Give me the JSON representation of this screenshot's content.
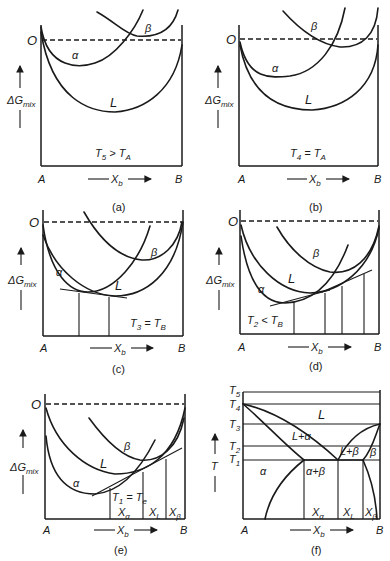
{
  "figure": {
    "panels": [
      {
        "id": "a",
        "caption": "(a)",
        "condition": {
          "T": "T",
          "T_sub": "5",
          "rel": " > ",
          "R": "T",
          "R_sub": "A"
        },
        "curve_labels": [
          "α",
          "β",
          "L"
        ],
        "origin_label": "O",
        "y_axis": {
          "main": "ΔG",
          "sub": "mix"
        },
        "x_axis": {
          "left": "A",
          "right": "B",
          "label": "X",
          "label_sub": "b"
        }
      },
      {
        "id": "b",
        "caption": "(b)",
        "condition": {
          "T": "T",
          "T_sub": "4",
          "rel": " = ",
          "R": "T",
          "R_sub": "A"
        },
        "curve_labels": [
          "α",
          "β",
          "L"
        ],
        "origin_label": "O",
        "y_axis": {
          "main": "ΔG",
          "sub": "mix"
        },
        "x_axis": {
          "left": "A",
          "right": "B",
          "label": "X",
          "label_sub": "b"
        }
      },
      {
        "id": "c",
        "caption": "(c)",
        "condition": {
          "T": "T",
          "T_sub": "3",
          "rel": " = ",
          "R": "T",
          "R_sub": "B"
        },
        "curve_labels": [
          "α",
          "β",
          "L"
        ],
        "origin_label": "O",
        "y_axis": {
          "main": "ΔG",
          "sub": "mix"
        },
        "x_axis": {
          "left": "A",
          "right": "B",
          "label": "X",
          "label_sub": "b"
        }
      },
      {
        "id": "d",
        "caption": "(d)",
        "condition": {
          "T": "T",
          "T_sub": "2",
          "rel": " < ",
          "R": "T",
          "R_sub": "B"
        },
        "curve_labels": [
          "α",
          "β",
          "L"
        ],
        "origin_label": "O",
        "y_axis": {
          "main": "ΔG",
          "sub": "mix"
        },
        "x_axis": {
          "left": "A",
          "right": "B",
          "label": "X",
          "label_sub": "b"
        }
      },
      {
        "id": "e",
        "caption": "(e)",
        "condition": {
          "T": "T",
          "T_sub": "1",
          "rel": " = ",
          "R": "T",
          "R_sub": "e"
        },
        "curve_labels": [
          "α",
          "β",
          "L"
        ],
        "origin_label": "O",
        "y_axis": {
          "main": "ΔG",
          "sub": "mix"
        },
        "compositions": [
          {
            "main": "X",
            "sub": "α"
          },
          {
            "main": "X",
            "sub": "L"
          },
          {
            "main": "X",
            "sub": "β"
          }
        ],
        "x_axis": {
          "left": "A",
          "right": "B",
          "label": "X",
          "label_sub": "b"
        }
      },
      {
        "id": "f",
        "caption": "(f)",
        "y_axis": {
          "main": "T",
          "sub": ""
        },
        "temperatures": [
          {
            "main": "T",
            "sub": "5"
          },
          {
            "main": "T",
            "sub": "4"
          },
          {
            "main": "T",
            "sub": "3"
          },
          {
            "main": "T",
            "sub": "2"
          },
          {
            "main": "T",
            "sub": "1"
          }
        ],
        "regions": [
          "L",
          "L+α",
          "L+β",
          "α",
          "α+β",
          "β"
        ],
        "compositions": [
          {
            "main": "X",
            "sub": "α"
          },
          {
            "main": "X",
            "sub": "L"
          },
          {
            "main": "X",
            "sub": "β"
          }
        ],
        "x_axis": {
          "left": "A",
          "right": "B",
          "label": "X",
          "label_sub": "b"
        }
      }
    ]
  }
}
